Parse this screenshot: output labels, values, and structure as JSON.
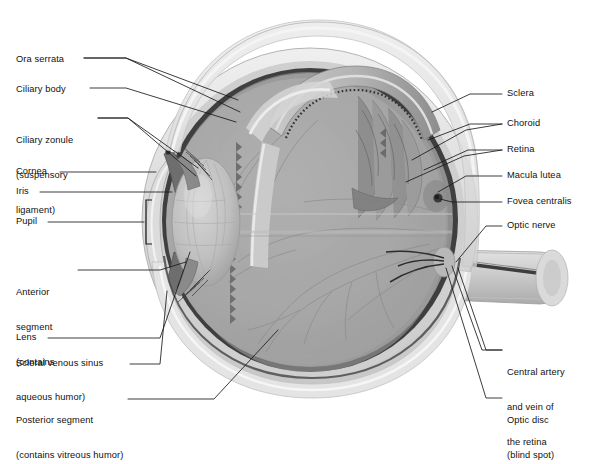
{
  "figure": {
    "type": "anatomical-diagram"
  },
  "colors": {
    "leader_line": "#1a1a1a",
    "label_text": "#111111",
    "sclera_outer": "#e6e6e6",
    "sclera_body": "#d2d2d2",
    "choroid": "#4a4a4a",
    "retina": "#9d9d9d",
    "vitreous": "#ababab",
    "lens": "#bdbdbd",
    "cornea": "#dcdcdc",
    "optic_nerve": "#cfcfcf",
    "background": "#ffffff"
  },
  "labels_left": [
    {
      "id": "ora-serrata",
      "text": "Ora serrata",
      "x": 16,
      "y": 60,
      "lines": [
        "Ora serrata"
      ]
    },
    {
      "id": "ciliary-body",
      "text": "Ciliary body",
      "x": 16,
      "y": 90,
      "lines": [
        "Ciliary body"
      ]
    },
    {
      "id": "ciliary-zonule",
      "text": "Ciliary zonule (suspensory ligament)",
      "x": 16,
      "y": 120,
      "lines": [
        "Ciliary zonule",
        "(suspensory",
        "ligament)"
      ]
    },
    {
      "id": "cornea",
      "text": "Cornea",
      "x": 16,
      "y": 168,
      "lines": [
        "Cornea"
      ]
    },
    {
      "id": "iris",
      "text": "Iris",
      "x": 16,
      "y": 190,
      "lines": [
        "Iris"
      ]
    },
    {
      "id": "pupil",
      "text": "Pupil",
      "x": 16,
      "y": 218,
      "lines": [
        "Pupil"
      ]
    },
    {
      "id": "anterior-segment",
      "text": "Anterior segment (contains aqueous humor)",
      "x": 16,
      "y": 266,
      "lines": [
        "Anterior",
        "segment",
        "(contains",
        "aqueous humor)"
      ]
    },
    {
      "id": "lens",
      "text": "Lens",
      "x": 16,
      "y": 334,
      "lines": [
        "Lens"
      ]
    },
    {
      "id": "scleral-venous-sinus",
      "text": "Scleral venous sinus",
      "x": 16,
      "y": 361,
      "lines": [
        "Scleral venous sinus"
      ]
    },
    {
      "id": "posterior-segment",
      "text": "Posterior segment (contains vitreous humor)",
      "x": 16,
      "y": 396,
      "lines": [
        "Posterior segment",
        "(contains vitreous humor)"
      ]
    }
  ],
  "labels_right": [
    {
      "id": "sclera",
      "text": "Sclera",
      "x": 507,
      "y": 92,
      "lines": [
        "Sclera"
      ]
    },
    {
      "id": "choroid",
      "text": "Choroid",
      "x": 507,
      "y": 122,
      "lines": [
        "Choroid"
      ]
    },
    {
      "id": "retina",
      "text": "Retina",
      "x": 507,
      "y": 148,
      "lines": [
        "Retina"
      ]
    },
    {
      "id": "macula-lutea",
      "text": "Macula lutea",
      "x": 507,
      "y": 174,
      "lines": [
        "Macula lutea"
      ]
    },
    {
      "id": "fovea-centralis",
      "text": "Fovea centralis",
      "x": 507,
      "y": 200,
      "lines": [
        "Fovea centralis"
      ]
    },
    {
      "id": "optic-nerve",
      "text": "Optic nerve",
      "x": 507,
      "y": 224,
      "lines": [
        "Optic nerve"
      ]
    },
    {
      "id": "central-artery-vein",
      "text": "Central artery and vein of the retina",
      "x": 507,
      "y": 348,
      "lines": [
        "Central artery",
        "and vein of",
        "the retina"
      ]
    },
    {
      "id": "optic-disc",
      "text": "Optic disc (blind spot)",
      "x": 507,
      "y": 396,
      "lines": [
        "Optic disc",
        "(blind spot)"
      ]
    }
  ]
}
